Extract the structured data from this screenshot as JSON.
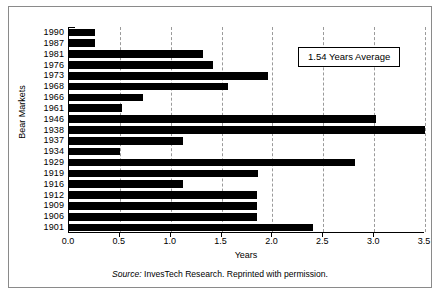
{
  "chart_data": {
    "type": "bar",
    "orientation": "horizontal",
    "title": "",
    "xlabel": "Years",
    "ylabel": "Bear Markets",
    "xlim": [
      0.0,
      3.5
    ],
    "grid": true,
    "legend_position": "none",
    "xticks": [
      "0.0",
      "0.5",
      "1.0",
      "1.5",
      "2.0",
      "2.5",
      "3.0",
      "3.5"
    ],
    "xtick_values": [
      0.0,
      0.5,
      1.0,
      1.5,
      2.0,
      2.5,
      3.0,
      3.5
    ],
    "categories": [
      "1990",
      "1987",
      "1981",
      "1976",
      "1973",
      "1968",
      "1966",
      "1961",
      "1946",
      "1938",
      "1937",
      "1934",
      "1929",
      "1919",
      "1916",
      "1912",
      "1909",
      "1906",
      "1901"
    ],
    "values": [
      0.26,
      0.26,
      1.32,
      1.42,
      1.96,
      1.56,
      0.73,
      0.52,
      3.02,
      3.5,
      1.12,
      0.5,
      2.81,
      1.86,
      1.12,
      1.85,
      1.85,
      1.85,
      2.4
    ],
    "bar_color": "#000000",
    "annotations": [
      {
        "text": "1.54 Years Average",
        "value": 1.54
      }
    ]
  },
  "annotation": {
    "label": "1.54 Years Average"
  },
  "axis": {
    "x_title": "Years",
    "y_title": "Bear Markets"
  },
  "source": {
    "prefix": "Source:",
    "text": " InvesTech Research. Reprinted with permission."
  }
}
